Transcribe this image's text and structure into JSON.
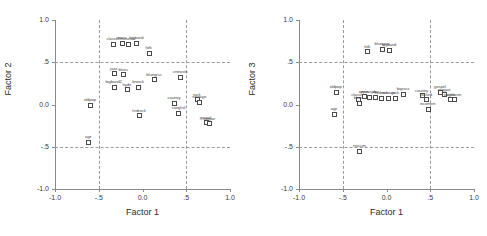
{
  "figure": {
    "panels": [
      {
        "id": "panel-left",
        "xlabel": "Factor 1",
        "ylabel": "Factor 2"
      },
      {
        "id": "panel-right",
        "xlabel": "Factor 1",
        "ylabel": "Factor 3"
      }
    ],
    "xticks": [
      "-1.0",
      "-.5",
      "0.0",
      ".5",
      "1.0"
    ],
    "yticks": [
      "1.0",
      ".5",
      "0.0",
      "-.5",
      "-1.0"
    ]
  },
  "chart_data": [
    {
      "type": "scatter",
      "title": "",
      "xlabel": "Factor 1",
      "ylabel": "Factor 2",
      "xlim": [
        -1.0,
        1.0
      ],
      "ylim": [
        -1.0,
        1.0
      ],
      "xticks": [
        -1.0,
        -0.5,
        0.0,
        0.5,
        1.0
      ],
      "yticks": [
        -1.0,
        -0.5,
        0.0,
        0.5,
        1.0
      ],
      "xticklabels": [
        "-1.0",
        "-.5",
        "0.0",
        ".5",
        "1.0"
      ],
      "yticklabels": [
        "-1.0",
        "-.5",
        "0.0",
        ".5",
        "1.0"
      ],
      "grid": "dashed gridlines at x=-.5, x=.5, y=-.5, y=.5",
      "legend": "none",
      "points": [
        {
          "label": "classicl",
          "x": -0.34,
          "y": 0.72
        },
        {
          "label": "opera",
          "x": -0.24,
          "y": 0.73
        },
        {
          "label": "musicals",
          "x": -0.17,
          "y": 0.72
        },
        {
          "label": "bigband",
          "x": -0.07,
          "y": 0.73
        },
        {
          "label": "folk",
          "x": 0.07,
          "y": 0.61
        },
        {
          "label": "jazz",
          "x": -0.33,
          "y": 0.37
        },
        {
          "label": "blues",
          "x": -0.22,
          "y": 0.36
        },
        {
          "label": "bluegrss",
          "x": 0.13,
          "y": 0.3
        },
        {
          "label": "cntrwstn",
          "x": 0.43,
          "y": 0.33
        },
        {
          "label": "bigband2",
          "x": -0.33,
          "y": 0.21
        },
        {
          "label": "hydn",
          "x": -0.18,
          "y": 0.18
        },
        {
          "label": "brwrck",
          "x": -0.05,
          "y": 0.21
        },
        {
          "label": "oldpop",
          "x": -0.6,
          "y": 0.0
        },
        {
          "label": "country",
          "x": 0.36,
          "y": 0.02
        },
        {
          "label": "rock",
          "x": 0.62,
          "y": 0.06
        },
        {
          "label": "newage",
          "x": 0.65,
          "y": 0.03
        },
        {
          "label": "hrdrock",
          "x": -0.04,
          "y": -0.13
        },
        {
          "label": "conglstl",
          "x": 0.41,
          "y": -0.1
        },
        {
          "label": "gospel",
          "x": 0.72,
          "y": -0.21
        },
        {
          "label": "reggae",
          "x": 0.76,
          "y": -0.22
        },
        {
          "label": "age",
          "x": -0.62,
          "y": -0.44
        }
      ]
    },
    {
      "type": "scatter",
      "title": "",
      "xlabel": "Factor 1",
      "ylabel": "Factor 3",
      "xlim": [
        -1.0,
        1.0
      ],
      "ylim": [
        -1.0,
        1.0
      ],
      "xticks": [
        -1.0,
        -0.5,
        0.0,
        0.5,
        1.0
      ],
      "yticks": [
        -1.0,
        -0.5,
        0.0,
        0.5,
        1.0
      ],
      "xticklabels": [
        "-1.0",
        "-.5",
        "0.0",
        ".5",
        "1.0"
      ],
      "yticklabels": [
        "-1.0",
        "-.5",
        "0.0",
        ".5",
        "1.0"
      ],
      "grid": "dashed gridlines at x=-.5, x=.5, y=-.5, y=.5",
      "legend": "none",
      "points": [
        {
          "label": "folk",
          "x": -0.22,
          "y": 0.63
        },
        {
          "label": "bluegrss",
          "x": -0.05,
          "y": 0.66
        },
        {
          "label": "bigband",
          "x": 0.03,
          "y": 0.65
        },
        {
          "label": "oldpop",
          "x": -0.58,
          "y": 0.15
        },
        {
          "label": "classicl",
          "x": -0.33,
          "y": 0.06
        },
        {
          "label": "blues",
          "x": -0.32,
          "y": 0.02
        },
        {
          "label": "opera",
          "x": -0.26,
          "y": 0.1
        },
        {
          "label": "musicals",
          "x": -0.2,
          "y": 0.09
        },
        {
          "label": "jazz",
          "x": -0.13,
          "y": 0.09
        },
        {
          "label": "hrdrock",
          "x": -0.06,
          "y": 0.08
        },
        {
          "label": "newage",
          "x": 0.02,
          "y": 0.08
        },
        {
          "label": "rock",
          "x": 0.1,
          "y": 0.08
        },
        {
          "label": "bigrass",
          "x": 0.19,
          "y": 0.13
        },
        {
          "label": "country",
          "x": 0.4,
          "y": 0.11
        },
        {
          "label": "rocked",
          "x": 0.45,
          "y": 0.06
        },
        {
          "label": "incomert",
          "x": 0.47,
          "y": -0.05
        },
        {
          "label": "gospel",
          "x": 0.61,
          "y": 0.15
        },
        {
          "label": "reggae",
          "x": 0.66,
          "y": 0.12
        },
        {
          "label": "opgsls",
          "x": 0.72,
          "y": 0.06
        },
        {
          "label": "cntrwstn",
          "x": 0.77,
          "y": 0.06
        },
        {
          "label": "age",
          "x": -0.6,
          "y": -0.11
        },
        {
          "label": "ntscum",
          "x": -0.31,
          "y": -0.55
        }
      ]
    }
  ]
}
